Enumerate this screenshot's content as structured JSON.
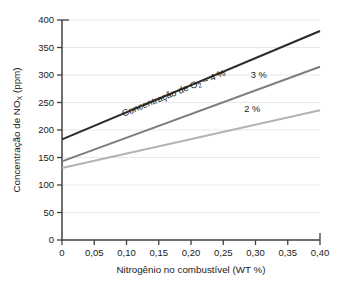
{
  "chart_data": {
    "type": "line",
    "title": "",
    "xlabel": "Nitrogênio no combustível (WT %)",
    "ylabel": "Concentração de NOx (ppm)",
    "ylabel_parts": {
      "prefix": "Concentração de NO",
      "subscript": "X",
      "suffix": " (ppm)"
    },
    "xlim": [
      0,
      0.4
    ],
    "ylim": [
      0,
      400
    ],
    "grid": true,
    "grid_axis": "y",
    "legend_position": "inline-annotations",
    "x_tick_labels": [
      "0",
      "0,05",
      "0,10",
      "0,15",
      "0,20",
      "0,25",
      "0,30",
      "0,35",
      "0,40"
    ],
    "x_tick_values": [
      0,
      0.05,
      0.1,
      0.15,
      0.2,
      0.25,
      0.3,
      0.35,
      0.4
    ],
    "y_tick_labels": [
      "0",
      "50",
      "100",
      "150",
      "200",
      "250",
      "300",
      "350",
      "400"
    ],
    "y_tick_values": [
      0,
      50,
      100,
      150,
      200,
      250,
      300,
      350,
      400
    ],
    "x": [
      0,
      0.4
    ],
    "series": [
      {
        "name": "Concentração de O2 – 4 %",
        "label": "4 %",
        "values": [
          183,
          380
        ],
        "color": "#2b2b2b",
        "width": 2.1
      },
      {
        "name": "3 %",
        "label": "3 %",
        "values": [
          143,
          315
        ],
        "color": "#7d7d7d",
        "width": 1.9
      },
      {
        "name": "2 %",
        "label": "2 %",
        "values": [
          131,
          236
        ],
        "color": "#b3b3b3",
        "width": 1.9
      }
    ],
    "annotations": [
      {
        "id": "o2-label",
        "text": "Concentração de O2 – 4 %",
        "text_prefix": "Concentração de O",
        "text_subscript": "2",
        "text_suffix": " – 4 %",
        "x": 0.175,
        "y": 262,
        "rotation": -22
      },
      {
        "id": "three-percent-label",
        "text": "3 %",
        "x": 0.305,
        "y": 295,
        "rotation": 0
      },
      {
        "id": "two-percent-label",
        "text": "2 %",
        "x": 0.295,
        "y": 232,
        "rotation": 0
      }
    ],
    "colors": {
      "axis": "#404040",
      "grid": "#e8e8e8",
      "text": "#1a1a1a",
      "background": "#ffffff"
    }
  }
}
